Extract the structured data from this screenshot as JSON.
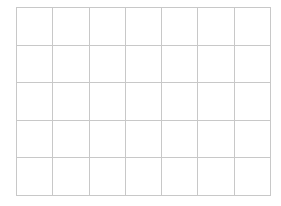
{
  "grid": {
    "rows": 5,
    "columns": 7,
    "line_color": "#c8c8c8",
    "background": "#ffffff",
    "cells": [
      [
        "",
        "",
        "",
        "",
        "",
        "",
        ""
      ],
      [
        "",
        "",
        "",
        "",
        "",
        "",
        ""
      ],
      [
        "",
        "",
        "",
        "",
        "",
        "",
        ""
      ],
      [
        "",
        "",
        "",
        "",
        "",
        "",
        ""
      ],
      [
        "",
        "",
        "",
        "",
        "",
        "",
        ""
      ]
    ]
  }
}
